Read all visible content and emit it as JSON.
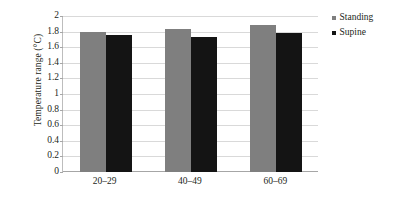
{
  "chart_data": {
    "type": "bar",
    "title": "",
    "subtitle": "",
    "xlabel": "",
    "ylabel": "Temperature range (°C)",
    "categories": [
      "20–29",
      "40–49",
      "60–69"
    ],
    "series": [
      {
        "name": "Standing",
        "color": "#7f7f7f",
        "values": [
          1.79,
          1.83,
          1.88
        ]
      },
      {
        "name": "Supine",
        "color": "#141414",
        "values": [
          1.76,
          1.73,
          1.78
        ]
      }
    ],
    "ylim": [
      0,
      2
    ],
    "ytick_step": 0.2,
    "ytick_labels": [
      "0",
      "0.2",
      "0.4",
      "0.6",
      "0.8",
      "1",
      "1.2",
      "1.4",
      "1.6",
      "1.8",
      "2"
    ],
    "ytick_values": [
      0,
      0.2,
      0.4,
      0.6,
      0.8,
      1,
      1.2,
      1.4,
      1.6,
      1.8,
      2
    ],
    "grid": true,
    "grid_axis": "y",
    "legend_position": "right",
    "legend_marker": "square",
    "background_color": "#ffffff",
    "gridline_color": "#d9d9d9",
    "axis_color": "#a6a6a6",
    "text_color": "#231f20"
  }
}
